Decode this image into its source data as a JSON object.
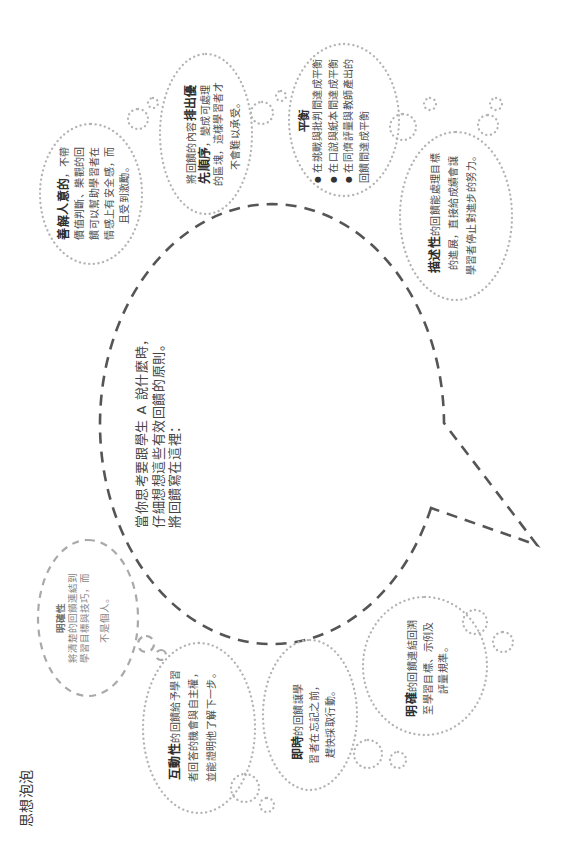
{
  "page_title": "思想泡泡",
  "prompt": {
    "lines": [
      "當你思考要跟學生 A 說什麼時，",
      "仔細想想這些有效回饋的原則。",
      "將回饋寫在這裡："
    ]
  },
  "bubbles": {
    "clarity": {
      "title": "明確性",
      "lines": [
        "將清楚的回饋連結到",
        "學習目標與技巧，而",
        "不是個人。"
      ]
    },
    "empathetic": {
      "lines": [
        {
          "bold": "善解人意的",
          "post": "，不帶"
        },
        {
          "post": "價值判斷、樂觀的回"
        },
        {
          "post": "饋可以幫助學習者在"
        },
        {
          "post": "情感上有安全感，而"
        },
        {
          "post": "且受到激勵。"
        }
      ]
    },
    "prioritized": {
      "lines": [
        {
          "pre": "將回饋的內容",
          "bold": "排出優"
        },
        {
          "bold": "先順序",
          "post": "，變成可處理"
        },
        {
          "post": "的區塊，這樣學習者才"
        },
        {
          "post": "不會難以承受。"
        }
      ]
    },
    "balanced": {
      "title": "平衡",
      "bullets": [
        "在挑戰與批判間達成平衡",
        "在口說與紙本間達成平衡",
        "在同儕評量與教師產出的"
      ],
      "continuation": "回饋間達成平衡"
    },
    "descriptive": {
      "lines": [
        {
          "bold": "描述性",
          "post": "的回饋能處理目標"
        },
        {
          "post": "的進展，直接給成績會讓"
        },
        {
          "post": "學習者停止對進步的努力。"
        }
      ]
    },
    "interactive": {
      "lines": [
        {
          "bold": "互動性",
          "post": "的回饋給予學習"
        },
        {
          "post": "者回答的機會與自主權，"
        },
        {
          "post": "並能證明他了解下一步。"
        }
      ]
    },
    "timely": {
      "lines": [
        {
          "bold": "即時",
          "post": "的回饋讓學"
        },
        {
          "post": "習者在忘記之前，"
        },
        {
          "post": "趕快採取行動。"
        }
      ]
    },
    "specific": {
      "lines": [
        {
          "bold": "明確",
          "post": "的回饋連結回溯"
        },
        {
          "post": "至學習目標、示例及"
        },
        {
          "post": "評量規準。"
        }
      ]
    }
  },
  "icons": {
    "bullet": "●"
  },
  "colors": {
    "dotted_outline": "#b3b3b3",
    "speech_bubble_dash": "#555555",
    "clarity_dash": "#a9a9a9",
    "text": "#4a4a4a",
    "bold_text": "#2f2f2f"
  }
}
